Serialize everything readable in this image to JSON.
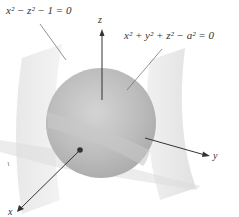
{
  "figure": {
    "equations": {
      "cylinder": {
        "text": "x² − z² − 1 = 0"
      },
      "sphere": {
        "text": "x² + y² + z² − a² = 0"
      }
    },
    "axes": {
      "x": {
        "label": "x"
      },
      "y": {
        "label": "y"
      },
      "z": {
        "label": "z"
      }
    },
    "colors": {
      "sphere": "#b8b8b8",
      "sphere_highlight": "#d6d6d6",
      "surface": "#e6e6e6",
      "axis": "#333333",
      "leader": "#666666"
    }
  }
}
